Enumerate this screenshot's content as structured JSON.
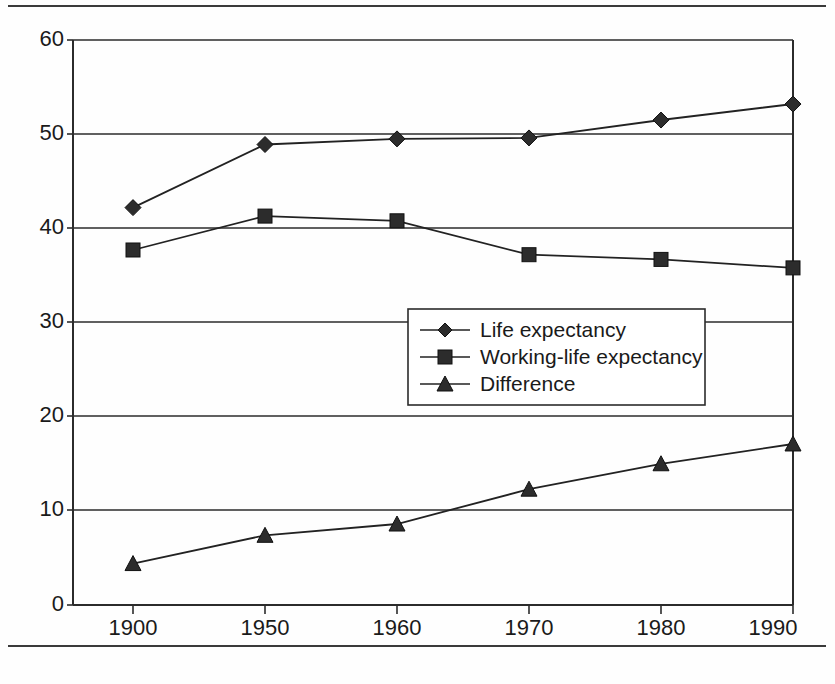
{
  "chart_data": {
    "type": "line",
    "title": "",
    "subtitle": "",
    "xlabel": "",
    "ylabel": "",
    "categories": [
      "1900",
      "1950",
      "1960",
      "1970",
      "1980",
      "1990"
    ],
    "series": [
      {
        "name": "Life expectancy",
        "marker": "diamond",
        "values": [
          42.2,
          48.9,
          49.5,
          49.6,
          51.5,
          53.2
        ]
      },
      {
        "name": "Working-life expectancy",
        "marker": "square",
        "values": [
          37.7,
          41.3,
          40.8,
          37.2,
          36.7,
          35.8
        ]
      },
      {
        "name": "Difference",
        "marker": "triangle",
        "values": [
          4.4,
          7.4,
          8.6,
          12.3,
          15.0,
          17.1
        ]
      }
    ],
    "ylim": [
      0,
      60
    ],
    "y_ticks": [
      "0",
      "10",
      "20",
      "30",
      "40",
      "50",
      "60"
    ],
    "y_tick_values": [
      0,
      10,
      20,
      30,
      40,
      50,
      60
    ],
    "grid": "horizontal",
    "legend_position": "center",
    "colors": {
      "line": "#222222",
      "marker": "#2c2c2c",
      "grid": "#2b2b2b",
      "background": "#fefefe"
    }
  },
  "legend": {
    "entries": [
      {
        "label": "Life expectancy",
        "marker": "diamond-marker-icon"
      },
      {
        "label": "Working-life expectancy",
        "marker": "square-marker-icon"
      },
      {
        "label": "Difference",
        "marker": "triangle-marker-icon"
      }
    ]
  }
}
